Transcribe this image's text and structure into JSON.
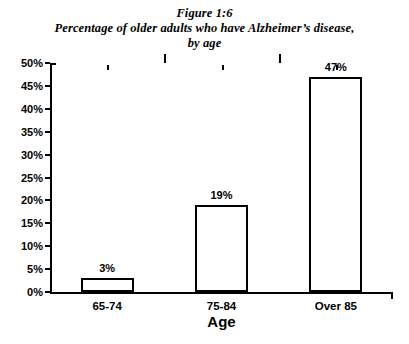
{
  "figure": {
    "title_lines": [
      "Figure 1:6",
      "Percentage of older adults who have Alzheimer’s disease,",
      "by age"
    ]
  },
  "chart_data": {
    "type": "bar",
    "title": "Figure 1:6 Percentage of older adults who have Alzheimer’s disease, by age",
    "categories": [
      "65-74",
      "75-84",
      "Over 85"
    ],
    "values": [
      3,
      19,
      47
    ],
    "data_labels": [
      "3%",
      "19%",
      "47%"
    ],
    "xlabel": "Age",
    "ylabel": "",
    "ylim": [
      0,
      50
    ],
    "ytick_step": 5,
    "ytick_labels": [
      "0%",
      "5%",
      "10%",
      "15%",
      "20%",
      "25%",
      "30%",
      "35%",
      "40%",
      "45%",
      "50%"
    ],
    "ytick_values": [
      0,
      5,
      10,
      15,
      20,
      25,
      30,
      35,
      40,
      45,
      50
    ],
    "grid": false,
    "legend": null,
    "bar_fill_color": "#ffffff",
    "bar_border_color": "#000000",
    "axis_color": "#000000",
    "background_color": "#ffffff"
  }
}
